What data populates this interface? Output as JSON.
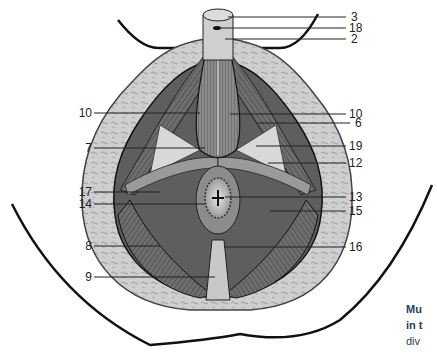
{
  "figure": {
    "labels_right": [
      {
        "id": "3",
        "text": "3",
        "x": 351,
        "y": 11
      },
      {
        "id": "18",
        "text": "18",
        "x": 349,
        "y": 22
      },
      {
        "id": "2",
        "text": "2",
        "x": 351,
        "y": 33
      },
      {
        "id": "10r",
        "text": "10",
        "x": 349,
        "y": 108
      },
      {
        "id": "6",
        "text": "6",
        "x": 355,
        "y": 117
      },
      {
        "id": "19",
        "text": "19",
        "x": 349,
        "y": 140
      },
      {
        "id": "12",
        "text": "12",
        "x": 349,
        "y": 157
      },
      {
        "id": "13",
        "text": "13",
        "x": 349,
        "y": 191
      },
      {
        "id": "15",
        "text": "15",
        "x": 349,
        "y": 205
      },
      {
        "id": "16",
        "text": "16",
        "x": 349,
        "y": 241
      }
    ],
    "labels_left": [
      {
        "id": "10l",
        "text": "10",
        "x": 78,
        "y": 107
      },
      {
        "id": "7",
        "text": "7",
        "x": 78,
        "y": 142
      },
      {
        "id": "17",
        "text": "17",
        "x": 78,
        "y": 186
      },
      {
        "id": "14",
        "text": "14",
        "x": 78,
        "y": 198
      },
      {
        "id": "8",
        "text": "8",
        "x": 78,
        "y": 240
      },
      {
        "id": "9",
        "text": "9",
        "x": 78,
        "y": 271
      }
    ]
  },
  "caption": {
    "line1": "Mu",
    "line2": "in t",
    "line3": "div"
  },
  "colors": {
    "caption": "#1e3f66",
    "outline": "#111111",
    "fat": "#c9c9c9",
    "muscle_dark": "#4a4a4a",
    "muscle_mid": "#7a7a7a",
    "muscle_light": "#b0b0b0"
  }
}
